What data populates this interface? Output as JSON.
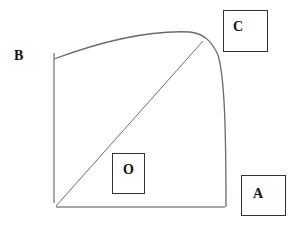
{
  "diagram": {
    "labels": {
      "b": "B",
      "c": "C",
      "o": "O",
      "a": "A"
    },
    "colors": {
      "line": "#6b6b6b",
      "text": "#111111",
      "box_border": "#333333",
      "background": "#ffffff"
    }
  }
}
